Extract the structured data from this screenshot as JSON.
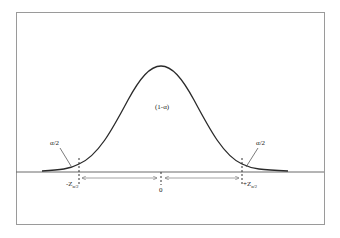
{
  "diagram": {
    "type": "normal-distribution",
    "center_label": "(1-α)",
    "left_tail_label": "α/2",
    "right_tail_label": "α/2",
    "left_critical_label": "-Z",
    "left_critical_sub": "α/2",
    "right_critical_label": "+Z",
    "right_critical_sub": "α/2",
    "center_value": "0",
    "colors": {
      "curve": "#2a2a2a",
      "frame": "#9a9a9a",
      "baseline": "#6a6a6a",
      "arrow": "#8a8a8a"
    }
  }
}
